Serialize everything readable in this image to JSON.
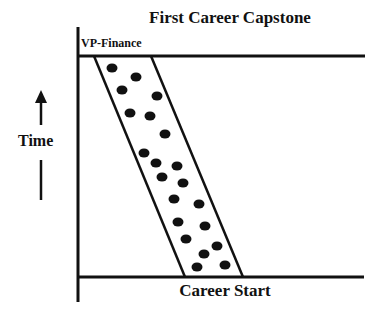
{
  "diagram": {
    "title": "First Career Capstone",
    "top_level_label": "VP-Finance",
    "bottom_level_label": "Career Start",
    "axis_label": "Time",
    "axis_direction": "up",
    "colors": {
      "ink": "#111111",
      "background": "#ffffff"
    },
    "band": {
      "description": "slanted band of cohort members moving from career start to first career capstone",
      "left_edge": [
        [
          94,
          56
        ],
        [
          185,
          277
        ]
      ],
      "right_edge": [
        [
          151,
          56
        ],
        [
          243,
          277
        ]
      ]
    },
    "dots": [
      [
        112,
        68
      ],
      [
        136,
        77
      ],
      [
        122,
        90
      ],
      [
        157,
        96
      ],
      [
        130,
        113
      ],
      [
        150,
        116
      ],
      [
        165,
        134
      ],
      [
        144,
        153
      ],
      [
        156,
        163
      ],
      [
        177,
        166
      ],
      [
        162,
        177
      ],
      [
        183,
        183
      ],
      [
        174,
        199
      ],
      [
        199,
        204
      ],
      [
        178,
        222
      ],
      [
        205,
        226
      ],
      [
        186,
        239
      ],
      [
        217,
        246
      ],
      [
        204,
        254
      ],
      [
        197,
        267
      ],
      [
        225,
        265
      ]
    ]
  }
}
